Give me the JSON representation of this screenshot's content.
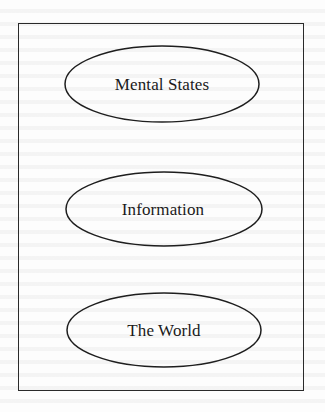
{
  "diagram": {
    "type": "stacked-ellipses",
    "colors": {
      "stroke": "#1e1e1e",
      "text": "#1a1a1a",
      "background": "#fdfdfd"
    },
    "frame": {
      "x": 18,
      "y": 23,
      "width": 286,
      "height": 368
    },
    "nodes": [
      {
        "label": "Mental States",
        "cx": 162,
        "cy": 84,
        "rx": 97,
        "ry": 38
      },
      {
        "label": "Information",
        "cx": 164,
        "cy": 209,
        "rx": 98,
        "ry": 37
      },
      {
        "label": "The World",
        "cx": 164,
        "cy": 330,
        "rx": 97,
        "ry": 37
      }
    ]
  }
}
